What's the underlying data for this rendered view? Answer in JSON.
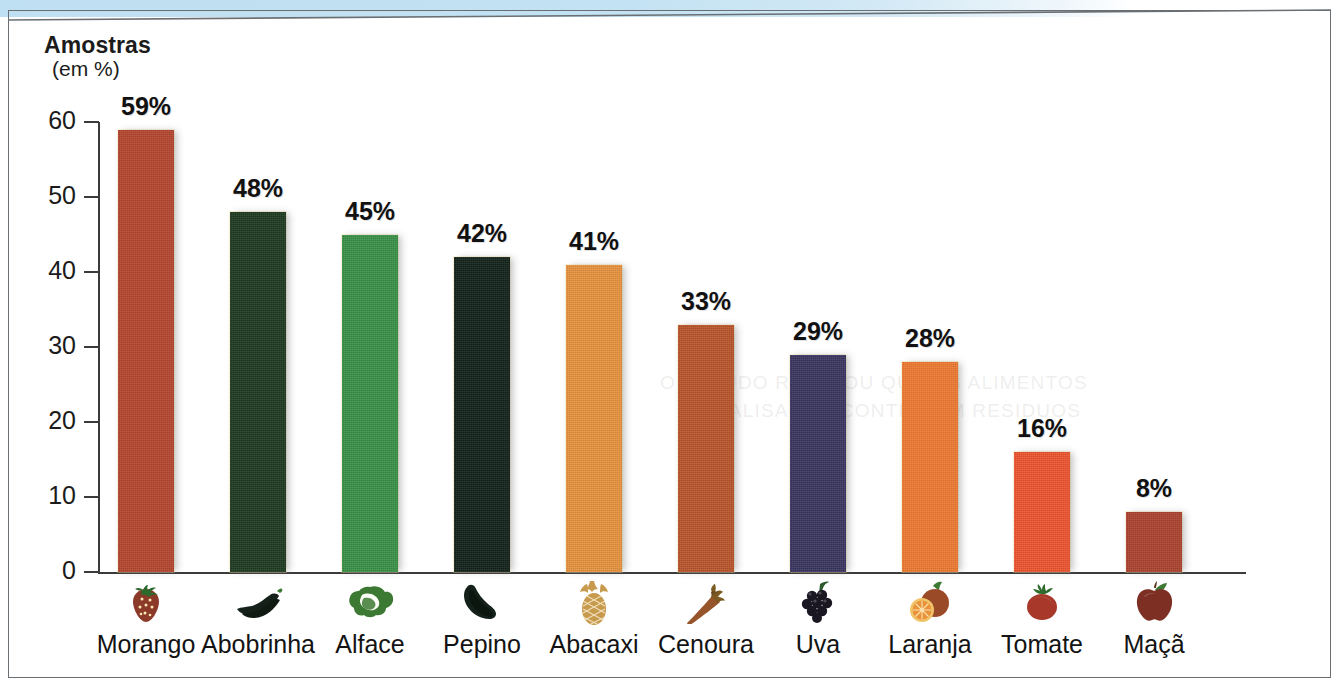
{
  "page": {
    "background_color": "#ffffff",
    "frame_color": "#6a6f73",
    "accent_strip_color": "#bfe0f2"
  },
  "axis": {
    "title": "Amostras",
    "subtitle": "(em %)",
    "y_ticks": [
      "60",
      "50",
      "40",
      "30",
      "20",
      "10",
      "0"
    ]
  },
  "chart_data": {
    "type": "bar",
    "title": "Amostras (em %)",
    "xlabel": "",
    "ylabel": "Amostras (em %)",
    "ylim": [
      0,
      60
    ],
    "ytick_step": 10,
    "grid": false,
    "legend": "none",
    "categories": [
      "Morango",
      "Abobrinha",
      "Alface",
      "Pepino",
      "Abacaxi",
      "Cenoura",
      "Uva",
      "Laranja",
      "Tomate",
      "Maçã"
    ],
    "values": [
      59,
      48,
      45,
      42,
      41,
      33,
      29,
      28,
      16,
      8
    ],
    "value_labels": [
      "59%",
      "48%",
      "45%",
      "42%",
      "41%",
      "33%",
      "29%",
      "28%",
      "16%",
      "8%"
    ],
    "colors": [
      "#b5462f",
      "#1e3a22",
      "#3a9147",
      "#12221a",
      "#e8933e",
      "#b9552b",
      "#3a3560",
      "#ef7a31",
      "#ee5430",
      "#ad4330"
    ],
    "icons": [
      "strawberry-icon",
      "zucchini-icon",
      "lettuce-icon",
      "cucumber-icon",
      "pineapple-icon",
      "carrot-icon",
      "grapes-icon",
      "orange-icon",
      "tomato-icon",
      "apple-icon"
    ],
    "icon_colors": [
      "#8b3a2a",
      "#16201a",
      "#3c7a33",
      "#14211a",
      "#c79a4e",
      "#96552a",
      "#1a1622",
      "#9a4a27",
      "#a8392a",
      "#7d2f24"
    ]
  },
  "ghost_text": {
    "line1": "O ESTUDO REVELOU QUE OS ALIMENTOS",
    "line2": "ANALISADOS CONTINHAM RESIDUOS"
  }
}
